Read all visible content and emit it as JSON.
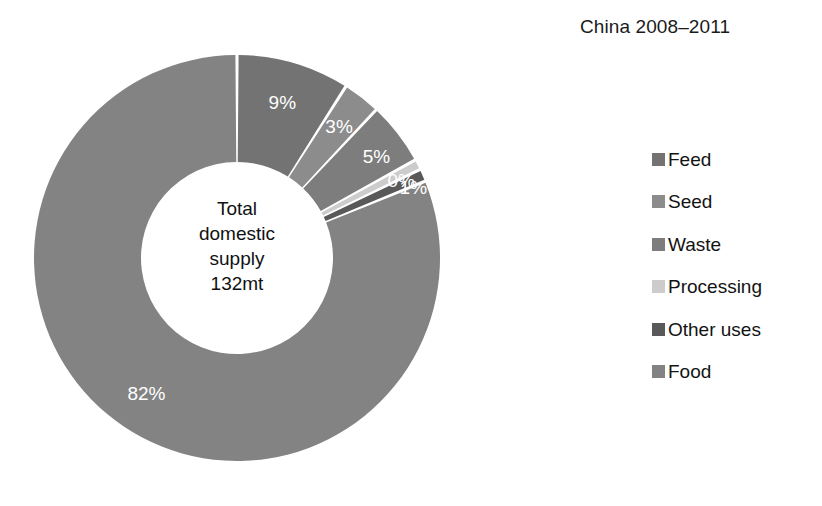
{
  "chart_data": {
    "type": "pie",
    "variant": "donut",
    "title": "China 2008–2011",
    "xlabel": "",
    "ylabel": "",
    "grid": false,
    "legend_position": "right",
    "center_label": {
      "lines": [
        "Total",
        "domestic",
        "supply",
        "132mt"
      ],
      "total_value": 132,
      "total_units": "mt"
    },
    "categories": [
      "Feed",
      "Seed",
      "Waste",
      "Processing",
      "Other uses",
      "Food"
    ],
    "values": [
      9,
      3,
      5,
      0,
      1,
      82
    ],
    "data_labels": [
      "9%",
      "3%",
      "5%",
      "0%",
      "1%",
      "82%"
    ],
    "colors": [
      "#737373",
      "#8c8c8c",
      "#7d7d7d",
      "#cccccc",
      "#595959",
      "#838383"
    ],
    "series": [
      {
        "name": "Share of total domestic supply",
        "units": "%",
        "values": [
          9,
          3,
          5,
          0,
          1,
          82
        ]
      }
    ],
    "slices": [
      {
        "label": "Feed",
        "value": 9,
        "data_label": "9%",
        "color": "#737373"
      },
      {
        "label": "Seed",
        "value": 3,
        "data_label": "3%",
        "color": "#8c8c8c"
      },
      {
        "label": "Waste",
        "value": 5,
        "data_label": "5%",
        "color": "#7d7d7d"
      },
      {
        "label": "Processing",
        "value": 0,
        "data_label": "0%",
        "color": "#cccccc"
      },
      {
        "label": "Other uses",
        "value": 1,
        "data_label": "1%",
        "color": "#595959"
      },
      {
        "label": "Food",
        "value": 82,
        "data_label": "82%",
        "color": "#838383"
      }
    ]
  },
  "title": {
    "text": "China –2011",
    "full": "China 2008–2011"
  },
  "header": {
    "title": "China 2008–2011"
  },
  "center": {
    "line1": "Total",
    "line2": "domestic",
    "line3": "supply",
    "line4": "132mt"
  },
  "labels": {
    "feed": "9%",
    "seed": "3%",
    "waste": "5%",
    "processing": "0%",
    "other_uses": "1%",
    "food": "82%"
  },
  "legend": {
    "items": [
      {
        "label": "Feed",
        "color": "#737373"
      },
      {
        "label": "Seed",
        "color": "#8c8c8c"
      },
      {
        "label": "Waste",
        "color": "#7d7d7d"
      },
      {
        "label": "Processing",
        "color": "#cccccc"
      },
      {
        "label": "Other uses",
        "color": "#595959"
      },
      {
        "label": "Food",
        "color": "#838383"
      }
    ]
  }
}
